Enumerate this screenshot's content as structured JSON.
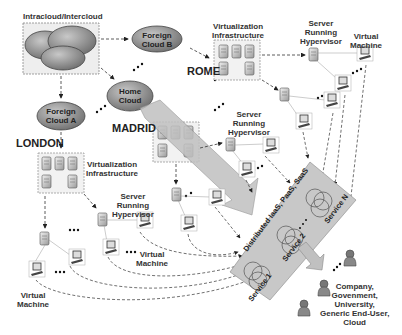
{
  "title": "Intracloud/Intercloud",
  "clouds": {
    "foreign_b": [
      "Foreign",
      "Cloud B"
    ],
    "home": [
      "Home",
      "Cloud"
    ],
    "foreign_a": [
      "Foreign",
      "Cloud A"
    ]
  },
  "cities": {
    "rome": "ROME",
    "madrid": "MADRID",
    "london": "LONDON"
  },
  "labels": {
    "virt_infra": [
      "Virtualization",
      "Infrastructure"
    ],
    "server": [
      "Server",
      "Running",
      "Hypervisor"
    ],
    "vm": [
      "Virtual",
      "Machine"
    ]
  },
  "banner": {
    "title": "Distributed IaaS, PaaS, SaaS",
    "services": [
      "Service 1",
      "Service 2",
      "Service N"
    ]
  },
  "users": {
    "caption": [
      "Company,",
      "Govenment,",
      "University,",
      "Generic End-User,",
      "Cloud"
    ]
  },
  "colors": {
    "cloud": "#8a8a8a",
    "banner": "#c8c8c8",
    "line": "#333333"
  }
}
